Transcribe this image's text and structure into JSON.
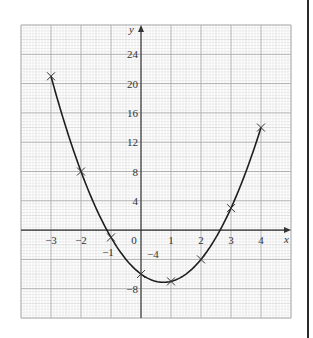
{
  "chart_data": {
    "type": "line",
    "title": "",
    "function": "y = 2x^2 - 3x - 6",
    "xlabel": "x",
    "ylabel": "y",
    "x": [
      -3,
      -2,
      -1,
      0,
      1,
      2,
      3,
      4
    ],
    "series": [
      {
        "name": "plotted points",
        "values": [
          21,
          8,
          -1,
          -6,
          -7,
          -4,
          3,
          14
        ]
      }
    ],
    "marker": "x",
    "xlim": [
      -4,
      5
    ],
    "ylim": [
      -12,
      28
    ],
    "x_tick_labels": [
      "−3",
      "−2",
      "−1",
      "0",
      "1",
      "2",
      "3",
      "4"
    ],
    "y_tick_labels": [
      "24",
      "20",
      "16",
      "12",
      "8",
      "4",
      "−4",
      "−8"
    ],
    "grid": true,
    "legend": null
  },
  "colors": {
    "curve": "#1e1e1e",
    "axis": "#333333",
    "grid_minor": "#dcdcdc",
    "grid_major": "#a8a8a8",
    "text": "#333333"
  }
}
